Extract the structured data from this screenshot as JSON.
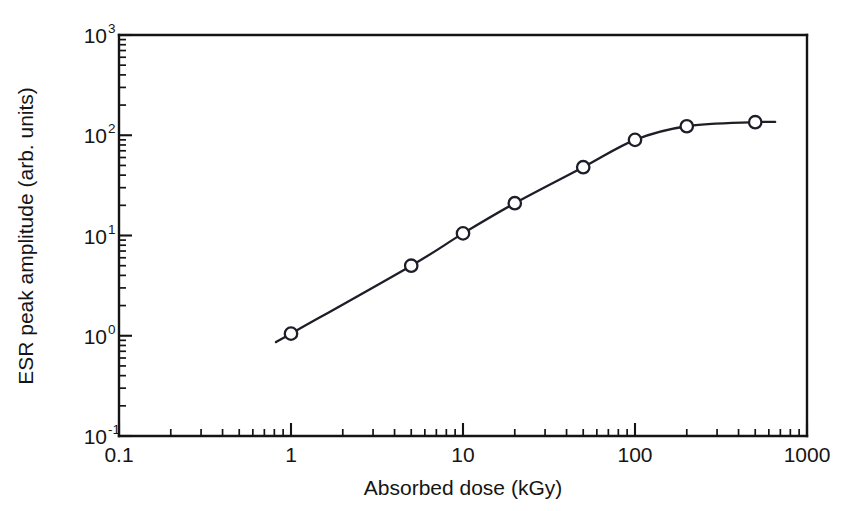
{
  "chart_data": {
    "type": "line",
    "title": "",
    "subtitle": "",
    "xlabel": "Absorbed dose (kGy)",
    "ylabel": "ESR peak amplitude (arb. units)",
    "xscale": "log",
    "yscale": "log",
    "xlim": [
      0.1,
      1000
    ],
    "ylim": [
      0.1,
      1000
    ],
    "grid": false,
    "legend": null,
    "x_tick_labels": [
      "0.1",
      "1",
      "10",
      "100",
      "1000"
    ],
    "x_tick_values": [
      0.1,
      1,
      10,
      100,
      1000
    ],
    "y_tick_labels": [
      "10-1",
      "100",
      "101",
      "102",
      "103"
    ],
    "y_tick_mantissa": [
      "10",
      "10",
      "10",
      "10",
      "10"
    ],
    "y_tick_exponents": [
      "-1",
      "0",
      "1",
      "2",
      "3"
    ],
    "y_tick_values": [
      0.1,
      1,
      10,
      100,
      1000
    ],
    "marker_style": "open-circle",
    "series": [
      {
        "name": "ESR peak amplitude",
        "x": [
          1,
          5,
          10,
          20,
          50,
          100,
          200,
          500
        ],
        "values": [
          1.05,
          5.0,
          10.5,
          21.0,
          48.0,
          90.0,
          123.0,
          135.0
        ]
      }
    ],
    "annotations": []
  },
  "axis_labels": {
    "x": "Absorbed dose (kGy)",
    "y": "ESR peak amplitude (arb. units)"
  },
  "colors": {
    "axis": "#141414",
    "curve": "#1e1e28",
    "marker_fill": "#ffffff",
    "background": "#ffffff"
  }
}
